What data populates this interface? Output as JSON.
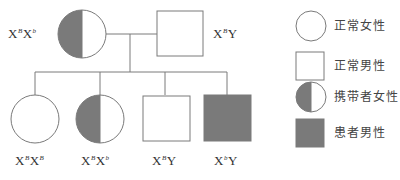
{
  "colors": {
    "line": "#7a7a7a",
    "affected_fill": "#7a7a7a",
    "background": "#ffffff"
  },
  "pedigree": {
    "parents": [
      {
        "id": "mother",
        "sex": "female",
        "status": "carrier",
        "genotype": {
          "x1": "X",
          "a1": "B",
          "x2": "X",
          "a2": "b",
          "y": ""
        }
      },
      {
        "id": "father",
        "sex": "male",
        "status": "normal",
        "genotype": {
          "x1": "X",
          "a1": "B",
          "x2": "",
          "a2": "",
          "y": "Y"
        }
      }
    ],
    "children": [
      {
        "id": "child-1",
        "sex": "female",
        "status": "normal",
        "genotype": {
          "x1": "X",
          "a1": "B",
          "x2": "X",
          "a2": "B",
          "y": ""
        }
      },
      {
        "id": "child-2",
        "sex": "female",
        "status": "carrier",
        "genotype": {
          "x1": "X",
          "a1": "B",
          "x2": "X",
          "a2": "b",
          "y": ""
        }
      },
      {
        "id": "child-3",
        "sex": "male",
        "status": "normal",
        "genotype": {
          "x1": "X",
          "a1": "B",
          "x2": "",
          "a2": "",
          "y": "Y"
        }
      },
      {
        "id": "child-4",
        "sex": "male",
        "status": "affected",
        "genotype": {
          "x1": "X",
          "a1": "b",
          "x2": "",
          "a2": "",
          "y": "Y"
        }
      }
    ]
  },
  "legend": {
    "items": [
      {
        "symbol": "circle-open",
        "label": "正常女性"
      },
      {
        "symbol": "square-open",
        "label": "正常男性"
      },
      {
        "symbol": "circle-half",
        "label": "携带者女性"
      },
      {
        "symbol": "square-filled",
        "label": "患者男性"
      }
    ]
  }
}
